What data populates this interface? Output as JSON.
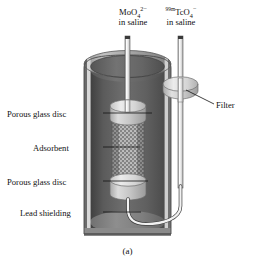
{
  "figure": {
    "caption": "(a)",
    "diagram_type": "cutaway-schematic",
    "background_color": "#ffffff"
  },
  "labels": {
    "inlet": {
      "formula_base": "MoO",
      "formula_sub": "4",
      "formula_sup": "2−",
      "line2": "in saline"
    },
    "outlet": {
      "formula_pre_sup": "99m",
      "formula_base": "TcO",
      "formula_sub": "4",
      "formula_sup": "−",
      "line2": "in saline"
    },
    "porous_glass_disc_top": "Porous glass disc",
    "adsorbent": "Adsorbent",
    "porous_glass_disc_bottom": "Porous glass disc",
    "lead_shielding": "Lead shielding",
    "filter": "Filter"
  },
  "colors": {
    "leader_line": "#1a1a1a",
    "shield_outer": "#8d8d8d",
    "shield_inner_dark": "#4a4a4a",
    "shield_rim_light": "#b9b9b9",
    "disc_light": "#cfcfcf",
    "adsorbent_mid": "#909090",
    "tube_white": "#f4f4f4",
    "text": "#111111"
  }
}
